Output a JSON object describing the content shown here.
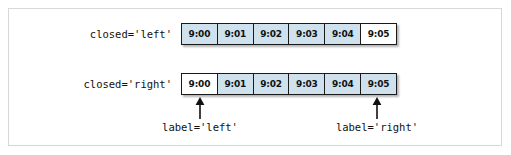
{
  "figure": {
    "rows": [
      {
        "name": "closed-left",
        "label": "closed='left'",
        "cells": [
          {
            "value": "9:00",
            "shaded": true
          },
          {
            "value": "9:01",
            "shaded": true
          },
          {
            "value": "9:02",
            "shaded": true
          },
          {
            "value": "9:03",
            "shaded": true
          },
          {
            "value": "9:04",
            "shaded": true
          },
          {
            "value": "9:05",
            "shaded": false
          }
        ]
      },
      {
        "name": "closed-right",
        "label": "closed='right'",
        "cells": [
          {
            "value": "9:00",
            "shaded": false
          },
          {
            "value": "9:01",
            "shaded": true
          },
          {
            "value": "9:02",
            "shaded": true
          },
          {
            "value": "9:03",
            "shaded": true
          },
          {
            "value": "9:04",
            "shaded": true
          },
          {
            "value": "9:05",
            "shaded": true
          }
        ]
      }
    ],
    "annotations": [
      {
        "name": "label-left",
        "text": "label='left'"
      },
      {
        "name": "label-right",
        "text": "label='right'"
      }
    ],
    "colors": {
      "shaded_cell": "#cfe1ec",
      "plain_cell": "#ffffff",
      "cell_border": "#1a1a1a",
      "frame_border": "#d8d8d8",
      "text": "#111111",
      "background": "#ffffff"
    }
  }
}
